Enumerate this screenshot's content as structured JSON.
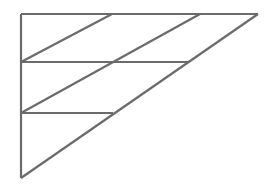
{
  "figure": {
    "canvas": {
      "width": 268,
      "height": 192,
      "background_color": "#ffffff"
    },
    "style": {
      "stroke_color": "#6b6b6b",
      "stroke_width": 2.2,
      "fill": "none"
    },
    "vertices": {
      "top_left": {
        "x": 21,
        "y": 14
      },
      "top_right": {
        "x": 258,
        "y": 14
      },
      "bottom_left": {
        "x": 21,
        "y": 178
      },
      "left_mid_upper": {
        "x": 21,
        "y": 62
      },
      "left_mid_lower": {
        "x": 21,
        "y": 113
      },
      "top_edge_point_a": {
        "x": 112,
        "y": 14
      },
      "top_edge_point_b": {
        "x": 200,
        "y": 14
      },
      "hypotenuse_point_upper": {
        "x": 190,
        "y": 62
      },
      "hypotenuse_point_lower": {
        "x": 113,
        "y": 113
      }
    },
    "segments": [
      {
        "name": "top-edge",
        "label": "Top horizontal edge",
        "x1": 21,
        "y1": 14,
        "x2": 258,
        "y2": 14
      },
      {
        "name": "left-edge",
        "label": "Left vertical edge",
        "x1": 21,
        "y1": 14,
        "x2": 21,
        "y2": 178
      },
      {
        "name": "hypotenuse",
        "label": "Hypotenuse from bottom-left to top-right",
        "x1": 21,
        "y1": 178,
        "x2": 258,
        "y2": 14
      },
      {
        "name": "horizontal-chord-upper",
        "label": "Upper horizontal chord",
        "x1": 21,
        "y1": 62,
        "x2": 190,
        "y2": 62
      },
      {
        "name": "horizontal-chord-lower",
        "label": "Lower horizontal chord",
        "x1": 21,
        "y1": 113,
        "x2": 113,
        "y2": 113
      },
      {
        "name": "diagonal-upper",
        "label": "Upper interior diagonal",
        "x1": 21,
        "y1": 62,
        "x2": 112,
        "y2": 14
      },
      {
        "name": "diagonal-lower",
        "label": "Lower interior diagonal",
        "x1": 21,
        "y1": 113,
        "x2": 200,
        "y2": 14
      }
    ]
  }
}
